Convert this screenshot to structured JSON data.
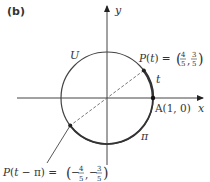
{
  "panel_label": "(b)",
  "axes": {
    "x_label": "x",
    "y_label": "y"
  },
  "circle_label": "U",
  "points": {
    "A": {
      "label": "A(1, 0)"
    },
    "P": {
      "label": "P(t) =",
      "x_num": "4",
      "x_den": "5",
      "y_num": "3",
      "y_den": "5"
    },
    "Q": {
      "label": "P(t − π) =",
      "x_num": "4",
      "x_den": "5",
      "y_num": "3",
      "y_den": "5",
      "sign": "−"
    }
  },
  "arc_labels": {
    "t": "t",
    "pi": "π"
  },
  "colors": {
    "stroke": "#333333",
    "arc": "#444444"
  }
}
